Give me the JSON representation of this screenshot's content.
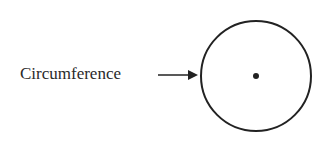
{
  "diagram": {
    "label": "Circumference",
    "arrow": {
      "from": [
        158,
        75
      ],
      "to": [
        198,
        75
      ],
      "color": "#222222"
    },
    "circle": {
      "cx": 256,
      "cy": 76,
      "r": 55,
      "stroke": "#222222",
      "stroke_width": 2
    },
    "center_dot": {
      "cx": 256,
      "cy": 76,
      "r": 3,
      "fill": "#222222"
    }
  }
}
